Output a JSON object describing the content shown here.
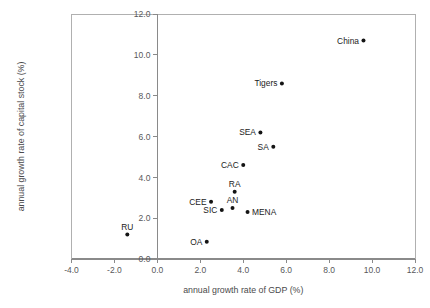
{
  "chart_data": {
    "type": "scatter",
    "title": "",
    "xlabel": "annual growth rate of GDP (%)",
    "ylabel": "annual growth rate of capital stock (%)",
    "xlim": [
      -4.0,
      12.0
    ],
    "ylim": [
      0.0,
      12.0
    ],
    "xticks": [
      "-4.0",
      "-2.0",
      "0.0",
      "2.0",
      "4.0",
      "6.0",
      "8.0",
      "10.0",
      "12.0"
    ],
    "xtick_values": [
      -4.0,
      -2.0,
      0.0,
      2.0,
      4.0,
      6.0,
      8.0,
      10.0,
      12.0
    ],
    "yticks": [
      "0.0",
      "2.0",
      "4.0",
      "6.0",
      "8.0",
      "10.0",
      "12.0"
    ],
    "ytick_values": [
      0.0,
      2.0,
      4.0,
      6.0,
      8.0,
      10.0,
      12.0
    ],
    "grid": false,
    "legend": "none",
    "marker": "filled-circle",
    "marker_color": "#141414",
    "points": [
      {
        "label": "China",
        "x": 9.6,
        "y": 10.7,
        "label_pos": "left"
      },
      {
        "label": "Tigers",
        "x": 5.8,
        "y": 8.6,
        "label_pos": "left"
      },
      {
        "label": "SEA",
        "x": 4.8,
        "y": 6.2,
        "label_pos": "left"
      },
      {
        "label": "SA",
        "x": 5.4,
        "y": 5.5,
        "label_pos": "left"
      },
      {
        "label": "CAC",
        "x": 4.0,
        "y": 4.6,
        "label_pos": "left"
      },
      {
        "label": "RA",
        "x": 3.6,
        "y": 3.3,
        "label_pos": "above"
      },
      {
        "label": "CEE",
        "x": 2.5,
        "y": 2.8,
        "label_pos": "left"
      },
      {
        "label": "AN",
        "x": 3.5,
        "y": 2.5,
        "label_pos": "above"
      },
      {
        "label": "SIC",
        "x": 3.0,
        "y": 2.4,
        "label_pos": "left"
      },
      {
        "label": "MENA",
        "x": 4.2,
        "y": 2.3,
        "label_pos": "right"
      },
      {
        "label": "RU",
        "x": -1.4,
        "y": 1.2,
        "label_pos": "above"
      },
      {
        "label": "OA",
        "x": 2.3,
        "y": 0.85,
        "label_pos": "left"
      }
    ]
  },
  "colors": {
    "marker": "#141414",
    "frame": "#b0b0b0",
    "axis": "#8a8a8a",
    "tick_text": "#58585a",
    "title_text": "#4a4a4c",
    "background": "#ffffff"
  }
}
